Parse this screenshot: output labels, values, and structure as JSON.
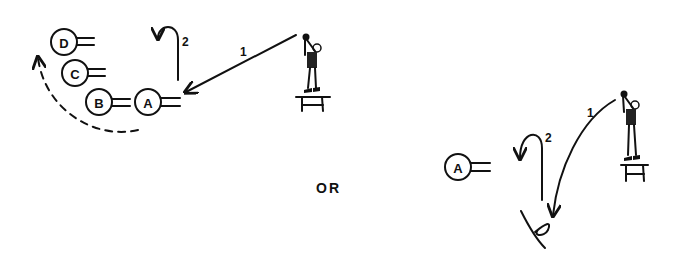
{
  "diagram": {
    "left_panel": {
      "players": [
        {
          "id": "D",
          "label": "D"
        },
        {
          "id": "C",
          "label": "C"
        },
        {
          "id": "B",
          "label": "B"
        },
        {
          "id": "A",
          "label": "A"
        }
      ],
      "pass_label": "1",
      "move_label": "2",
      "rotation_path": "dashed"
    },
    "separator_text": "OR",
    "right_panel": {
      "players": [
        {
          "id": "A",
          "label": "A"
        }
      ],
      "pass_label": "1",
      "move_label": "2"
    },
    "figures": [
      {
        "name": "passer-on-stool-left"
      },
      {
        "name": "passer-on-stool-right"
      }
    ]
  }
}
